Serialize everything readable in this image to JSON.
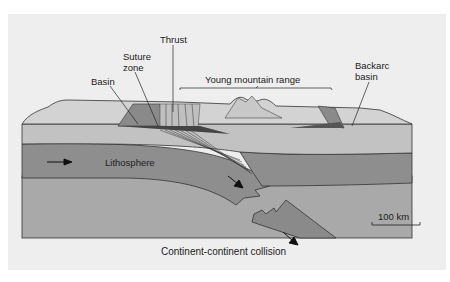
{
  "figure": {
    "title": "Continent-continent collision",
    "labels": {
      "thrust": "Thrust",
      "suture_zone_line1": "Suture",
      "suture_zone_line2": "zone",
      "basin": "Basin",
      "young_mountain_range": "Young mountain range",
      "backarc_basin_line1": "Backarc",
      "backarc_basin_line2": "basin",
      "lithosphere": "Lithosphere",
      "scale_bar": "100 km"
    },
    "colors": {
      "panel_bg": "#eeeeee",
      "surface_crust": "#cfcfcf",
      "upper_crust": "#bdbdbd",
      "lithosphere": "#8c8c8c",
      "asthenosphere": "#a8a8a8",
      "basin_fill": "#888888",
      "outline": "#333333"
    }
  }
}
